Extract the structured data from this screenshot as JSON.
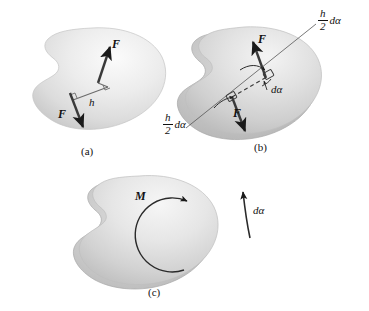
{
  "figure": {
    "title_caption_a": "(a)",
    "title_caption_b": "(b)",
    "title_caption_c": "(c)",
    "colors": {
      "body_light": "#ededed",
      "body_mid": "#d2d2d2",
      "body_dark": "#bdbdbd",
      "body_shadow": "#a9a9a9",
      "ink": "#1a1a1a",
      "background": "#ffffff"
    }
  },
  "panel_a": {
    "caption": "(a)",
    "force_top_label": "F",
    "force_bottom_label": "F",
    "distance_label": "h"
  },
  "panel_b": {
    "caption": "(b)",
    "force_top_label": "F",
    "force_bottom_label": "F",
    "angle_label": "dα",
    "arc_top": {
      "num": "h",
      "den": "2",
      "tail": "dα"
    },
    "arc_bottom": {
      "num": "h",
      "den": "2",
      "tail": "dα"
    }
  },
  "panel_c": {
    "caption": "(c)",
    "moment_label": "M",
    "angle_label": "dα"
  }
}
